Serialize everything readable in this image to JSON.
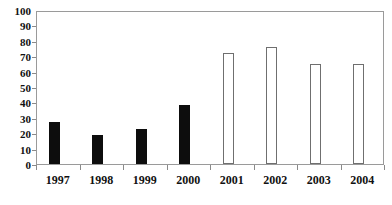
{
  "chart_data": {
    "type": "bar",
    "title": "",
    "subtitle": "",
    "xlabel": "",
    "ylabel": "",
    "categories": [
      "1997",
      "1998",
      "1999",
      "2000",
      "2001",
      "2002",
      "2003",
      "2004"
    ],
    "values": [
      27,
      19,
      23,
      38,
      72,
      76,
      65,
      65
    ],
    "bar_styles": [
      "filled",
      "filled",
      "filled",
      "filled",
      "hollow",
      "hollow",
      "hollow",
      "hollow"
    ],
    "ylim": [
      0,
      100
    ],
    "yticks": [
      0,
      10,
      20,
      30,
      40,
      50,
      60,
      70,
      80,
      90,
      100
    ],
    "ytick_labels": [
      "0",
      "10",
      "20",
      "30",
      "40",
      "50",
      "60",
      "70",
      "80",
      "90",
      "100"
    ],
    "grid": false,
    "legend": null,
    "annotations": [],
    "colors": {
      "filled_bar": "#0d0d0d",
      "hollow_bar_fill": "#ffffff",
      "hollow_bar_border": "#6f6f6f",
      "axis": "#9a9a9a",
      "text": "#111111",
      "background": "#ffffff"
    }
  }
}
